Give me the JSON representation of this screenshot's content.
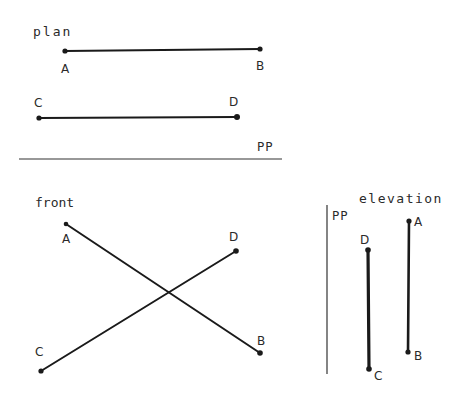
{
  "diagram": {
    "type": "orthographic-projection",
    "colors": {
      "ink": "#1a1a1a",
      "background": "#ffffff"
    },
    "plan": {
      "title": "plan",
      "picture_plane_label": "PP",
      "points": {
        "A": {
          "label": "A",
          "x": 65,
          "y": 51
        },
        "B": {
          "label": "B",
          "x": 260,
          "y": 49
        },
        "C": {
          "label": "C",
          "x": 39,
          "y": 118
        },
        "D": {
          "label": "D",
          "x": 237,
          "y": 117
        }
      },
      "segments": [
        [
          "A",
          "B"
        ],
        [
          "C",
          "D"
        ]
      ]
    },
    "front": {
      "title": "front",
      "points": {
        "A": {
          "label": "A",
          "x": 66,
          "y": 224
        },
        "B": {
          "label": "B",
          "x": 260,
          "y": 353
        },
        "C": {
          "label": "C",
          "x": 41,
          "y": 371
        },
        "D": {
          "label": "D",
          "x": 236,
          "y": 251
        }
      },
      "segments": [
        [
          "A",
          "B"
        ],
        [
          "C",
          "D"
        ]
      ]
    },
    "elevation": {
      "title": "elevation",
      "picture_plane_label": "PP",
      "points": {
        "A": {
          "label": "A",
          "x": 409,
          "y": 221
        },
        "B": {
          "label": "B",
          "x": 408,
          "y": 352
        },
        "C": {
          "label": "C",
          "x": 369,
          "y": 369
        },
        "D": {
          "label": "D",
          "x": 368,
          "y": 250
        }
      },
      "segments": [
        [
          "A",
          "B"
        ],
        [
          "D",
          "C"
        ]
      ]
    }
  }
}
